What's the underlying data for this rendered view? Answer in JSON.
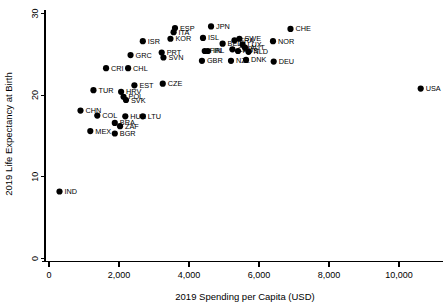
{
  "chart_data": {
    "type": "scatter",
    "title": "",
    "xlabel": "2019 Spending per Capita (USD)",
    "ylabel": "2019 Life Expectancy at Birth",
    "xlim": [
      -200,
      11400
    ],
    "ylim": [
      -1.2,
      31.0
    ],
    "xticks": [
      0,
      2000,
      4000,
      6000,
      8000,
      10000
    ],
    "xticklabels": [
      "0",
      "2,000",
      "4,000",
      "6,000",
      "8,000",
      "10,000"
    ],
    "yticks": [
      0,
      10,
      20,
      30
    ],
    "yticklabels": [
      "0",
      "10",
      "20",
      "30"
    ],
    "grid": false,
    "legend": false,
    "marker_color": "#000000",
    "points": [
      {
        "label": "IND",
        "x": 300,
        "y": 8.2
      },
      {
        "label": "CHN",
        "x": 900,
        "y": 18.1
      },
      {
        "label": "MEX",
        "x": 1180,
        "y": 15.6
      },
      {
        "label": "TUR",
        "x": 1270,
        "y": 20.6
      },
      {
        "label": "COL",
        "x": 1380,
        "y": 17.5
      },
      {
        "label": "CRI",
        "x": 1630,
        "y": 23.3
      },
      {
        "label": "BGR",
        "x": 1880,
        "y": 15.3
      },
      {
        "label": "BRA",
        "x": 1880,
        "y": 16.6
      },
      {
        "label": "ZAF",
        "x": 2030,
        "y": 16.2
      },
      {
        "label": "HRV",
        "x": 2060,
        "y": 20.4
      },
      {
        "label": "POL",
        "x": 2130,
        "y": 19.8
      },
      {
        "label": "HUN",
        "x": 2180,
        "y": 17.4
      },
      {
        "label": "SVK",
        "x": 2200,
        "y": 19.4
      },
      {
        "label": "CHL",
        "x": 2260,
        "y": 23.3
      },
      {
        "label": "GRC",
        "x": 2330,
        "y": 24.9
      },
      {
        "label": "LTU",
        "x": 2680,
        "y": 17.4
      },
      {
        "label": "EST",
        "x": 2440,
        "y": 21.2
      },
      {
        "label": "ISR",
        "x": 2680,
        "y": 26.6
      },
      {
        "label": "CZE",
        "x": 3250,
        "y": 21.4
      },
      {
        "label": "PRT",
        "x": 3220,
        "y": 25.2
      },
      {
        "label": "SVN",
        "x": 3270,
        "y": 24.6
      },
      {
        "label": "KOR",
        "x": 3470,
        "y": 26.9
      },
      {
        "label": "ITA",
        "x": 3560,
        "y": 27.7
      },
      {
        "label": "ESP",
        "x": 3600,
        "y": 28.2
      },
      {
        "label": "GBR",
        "x": 4370,
        "y": 24.2
      },
      {
        "label": "FIN",
        "x": 4450,
        "y": 25.4
      },
      {
        "label": "ISL",
        "x": 4400,
        "y": 27.0
      },
      {
        "label": "IRL",
        "x": 4540,
        "y": 25.4
      },
      {
        "label": "JPN",
        "x": 4630,
        "y": 28.4
      },
      {
        "label": "BEL",
        "x": 4960,
        "y": 26.3
      },
      {
        "label": "NZL",
        "x": 5200,
        "y": 24.2
      },
      {
        "label": "CAN",
        "x": 5240,
        "y": 25.6
      },
      {
        "label": "FRA",
        "x": 5300,
        "y": 26.7
      },
      {
        "label": "AUS",
        "x": 5400,
        "y": 25.4
      },
      {
        "label": "SWE",
        "x": 5440,
        "y": 26.9
      },
      {
        "label": "LUX",
        "x": 5530,
        "y": 26.2
      },
      {
        "label": "AUT",
        "x": 5600,
        "y": 25.8
      },
      {
        "label": "DNK",
        "x": 5630,
        "y": 24.3
      },
      {
        "label": "NLD",
        "x": 5700,
        "y": 25.3
      },
      {
        "label": "NOR",
        "x": 6400,
        "y": 26.6
      },
      {
        "label": "DEU",
        "x": 6420,
        "y": 24.1
      },
      {
        "label": "CHE",
        "x": 6900,
        "y": 28.1
      },
      {
        "label": "USA",
        "x": 10620,
        "y": 20.8
      }
    ],
    "label_offsets": {
      "IND": [
        5,
        2.5
      ],
      "CHN": [
        5,
        2.5
      ],
      "MEX": [
        5,
        2.5
      ],
      "TUR": [
        5,
        2.5
      ],
      "COL": [
        5,
        2.5
      ],
      "CRI": [
        5,
        2.5
      ],
      "BGR": [
        5,
        2.5
      ],
      "BRA": [
        5,
        2.5
      ],
      "ZAF": [
        5,
        2.5
      ],
      "HRV": [
        5,
        2.5
      ],
      "POL": [
        5,
        2.5
      ],
      "HUN": [
        5,
        2.5
      ],
      "SVK": [
        5,
        2.5
      ],
      "CHL": [
        5,
        2.5
      ],
      "GRC": [
        5,
        2.5
      ],
      "LTU": [
        5,
        2.5
      ],
      "EST": [
        5,
        2.5
      ],
      "ISR": [
        5,
        2.5
      ],
      "CZE": [
        5,
        2.5
      ],
      "PRT": [
        5,
        2.5
      ],
      "SVN": [
        5,
        2.5
      ],
      "KOR": [
        5,
        2.5
      ],
      "ITA": [
        5,
        2.5
      ],
      "ESP": [
        5,
        2.5
      ],
      "GBR": [
        5,
        2.5
      ],
      "FIN": [
        5,
        2.5
      ],
      "ISL": [
        5,
        2.5
      ],
      "IRL": [
        5,
        2.5
      ],
      "JPN": [
        5,
        2.5
      ],
      "BEL": [
        5,
        2.5
      ],
      "NZL": [
        5,
        2.5
      ],
      "CAN": [
        5,
        2.5
      ],
      "FRA": [
        5,
        2.5
      ],
      "AUS": [
        5,
        2.5
      ],
      "SWE": [
        5,
        2.5
      ],
      "LUX": [
        5,
        2.5
      ],
      "AUT": [
        5,
        2.5
      ],
      "DNK": [
        5,
        2.5
      ],
      "NLD": [
        5,
        2.5
      ],
      "NOR": [
        5,
        2.5
      ],
      "DEU": [
        5,
        2.5
      ],
      "CHE": [
        5,
        2.5
      ],
      "USA": [
        5,
        2.5
      ]
    }
  }
}
